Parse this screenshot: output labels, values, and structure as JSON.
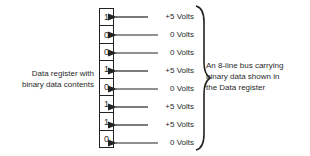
{
  "register_label": [
    "Data register with",
    "binary data contents"
  ],
  "bus_label": [
    "An 8-line bus carrying",
    "binary data shown in",
    "the Data register"
  ],
  "bits": [
    {
      "value": "1",
      "voltage": "+5 Volts"
    },
    {
      "value": "0",
      "voltage": "0 Volts"
    },
    {
      "value": "0",
      "voltage": "0 Volts"
    },
    {
      "value": "1",
      "voltage": "+5 Volts"
    },
    {
      "value": "0",
      "voltage": "0 Volts"
    },
    {
      "value": "1",
      "voltage": "+5 Volts"
    },
    {
      "value": "1",
      "voltage": "+5 Volts"
    },
    {
      "value": "0",
      "voltage": "0 Volts"
    }
  ]
}
